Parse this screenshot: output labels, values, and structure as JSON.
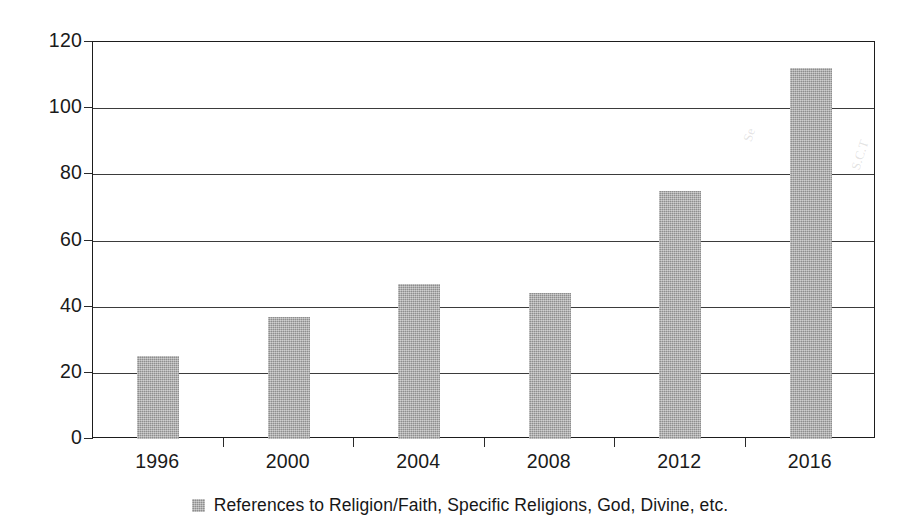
{
  "chart_data": {
    "type": "bar",
    "title": "",
    "subtitle": "",
    "xlabel": "",
    "ylabel": "",
    "categories": [
      "1996",
      "2000",
      "2004",
      "2008",
      "2012",
      "2016"
    ],
    "values": [
      25,
      37,
      47,
      44,
      75,
      112
    ],
    "series": [
      {
        "name": "References to Religion/Faith, Specific Religions, God, Divine, etc.",
        "values": [
          25,
          37,
          47,
          44,
          75,
          112
        ]
      }
    ],
    "ylim": [
      0,
      120
    ],
    "y_ticks": [
      0,
      20,
      40,
      60,
      80,
      100,
      120
    ],
    "y_tick_labels": [
      "0",
      "20",
      "40",
      "60",
      "80",
      "100",
      "120"
    ],
    "grid": true,
    "grid_axis": "y",
    "legend": {
      "position": "bottom-center",
      "entries": [
        {
          "label": "References to Religion/Faith, Specific Religions, God, Divine, etc.",
          "swatch_name": "legend-color-swatch"
        }
      ]
    },
    "colors": {
      "bar_fill": "#a2a2a2",
      "axis": "#1d1d1d",
      "gridline": "#3b3b3b",
      "text": "#1a1a1a",
      "background": "#ffffff"
    }
  }
}
